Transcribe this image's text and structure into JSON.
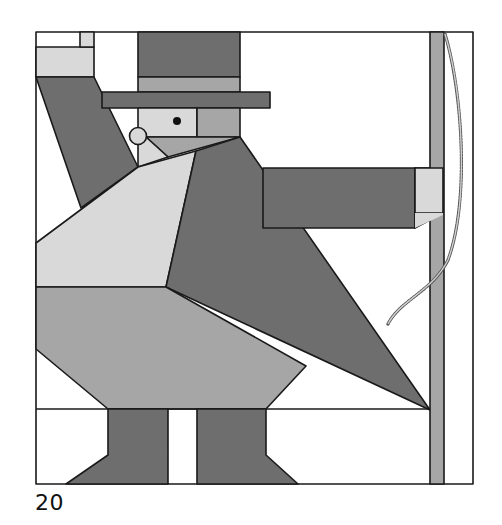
{
  "figure": {
    "number_label": "20",
    "colors": {
      "white": "#ffffff",
      "light": "#d9d9d9",
      "medium": "#a6a6a6",
      "dark": "#6e6e6e",
      "outline": "#1a1a1a",
      "eye": "#111111",
      "whip": "#bdbdbd"
    }
  }
}
